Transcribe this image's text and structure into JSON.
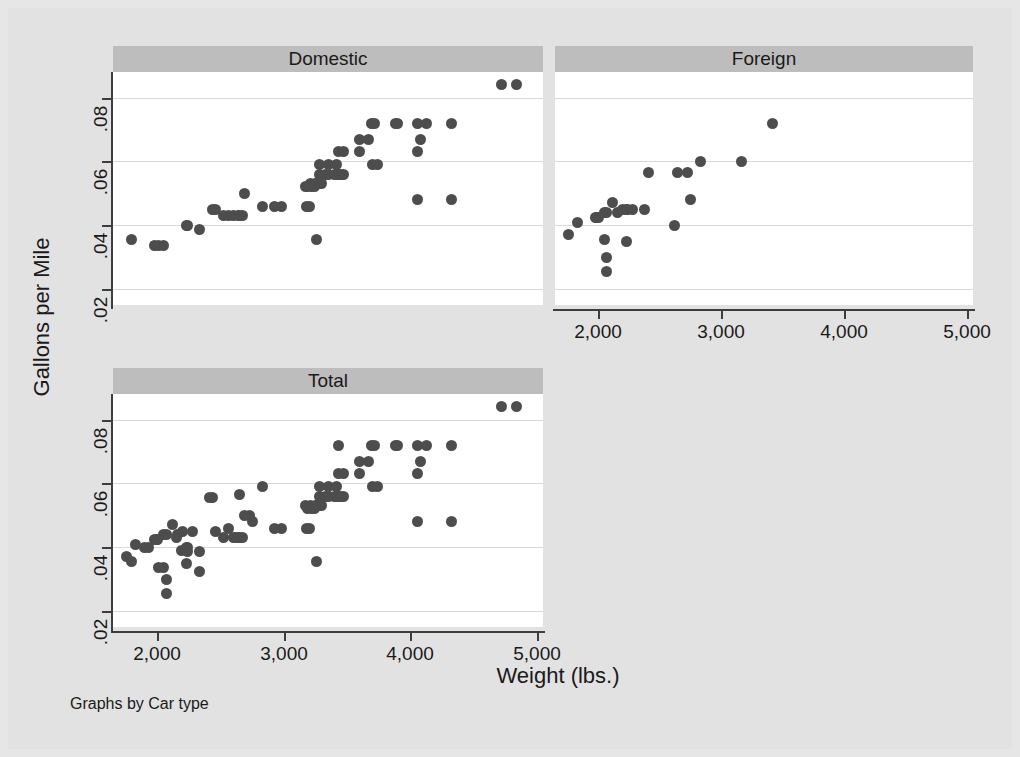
{
  "chart_data": {
    "type": "scatter",
    "title": "",
    "xlabel": "Weight (lbs.)",
    "ylabel": "Gallons per Mile",
    "note": "Graphs by Car type",
    "grid": true,
    "legend": "none",
    "marker_color": "#4d4d4d",
    "panel_title_bg": "#bdbdbd",
    "plot_bg": "#ffffff",
    "page_bg": "#e2e2e2",
    "xlim": [
      1650,
      5050
    ],
    "ylim": [
      0.015,
      0.088
    ],
    "xticks": [
      2000,
      3000,
      4000,
      5000
    ],
    "xtick_labels": [
      "2,000",
      "3,000",
      "4,000",
      "5,000"
    ],
    "yticks": [
      0.02,
      0.04,
      0.06,
      0.08
    ],
    "ytick_labels": [
      ".02",
      ".04",
      ".06",
      ".08"
    ],
    "panels": [
      {
        "label": "Domestic",
        "x": [
          4720,
          4840,
          3690,
          3720,
          3880,
          3900,
          4060,
          4130,
          4330,
          3600,
          3670,
          4080,
          3430,
          3470,
          3600,
          4060,
          3280,
          3350,
          3420,
          3700,
          3740,
          3280,
          3330,
          3350,
          3400,
          3420,
          3430,
          3450,
          3470,
          3210,
          3250,
          3260,
          3280,
          3300,
          3170,
          3190,
          3220,
          3240,
          2930,
          2980,
          3180,
          3200,
          2600,
          2640,
          2650,
          2670,
          2440,
          2460,
          2520,
          2560,
          2230,
          2240,
          2330,
          2690,
          2830,
          1800,
          1980,
          2010,
          2050,
          3260,
          4060,
          4330
        ],
        "y": [
          0.084,
          0.084,
          0.072,
          0.072,
          0.072,
          0.072,
          0.072,
          0.072,
          0.072,
          0.067,
          0.067,
          0.067,
          0.063,
          0.063,
          0.063,
          0.063,
          0.059,
          0.059,
          0.059,
          0.059,
          0.059,
          0.056,
          0.056,
          0.056,
          0.056,
          0.056,
          0.056,
          0.056,
          0.056,
          0.053,
          0.053,
          0.053,
          0.053,
          0.053,
          0.052,
          0.052,
          0.052,
          0.052,
          0.046,
          0.046,
          0.046,
          0.046,
          0.043,
          0.043,
          0.043,
          0.043,
          0.045,
          0.045,
          0.043,
          0.043,
          0.04,
          0.04,
          0.0385,
          0.05,
          0.046,
          0.0355,
          0.0335,
          0.0335,
          0.0335,
          0.0355,
          0.048,
          0.048
        ],
        "n": 52
      },
      {
        "label": "Foreign",
        "x": [
          3420,
          3170,
          2830,
          2650,
          2410,
          2730,
          2750,
          2280,
          2200,
          2230,
          2240,
          2380,
          2120,
          2050,
          2070,
          2160,
          1980,
          1990,
          2000,
          1830,
          1760,
          2050,
          2230,
          2070,
          2070,
          2620
        ],
        "y": [
          0.072,
          0.06,
          0.06,
          0.0565,
          0.0565,
          0.0565,
          0.048,
          0.045,
          0.045,
          0.045,
          0.045,
          0.045,
          0.047,
          0.044,
          0.044,
          0.044,
          0.0425,
          0.0425,
          0.0425,
          0.041,
          0.037,
          0.0355,
          0.035,
          0.03,
          0.0255,
          0.04
        ],
        "n": 26
      },
      {
        "label": "Total",
        "x": [
          4720,
          4840,
          3430,
          3690,
          3720,
          3880,
          3900,
          4060,
          4130,
          4330,
          3600,
          3670,
          4080,
          3430,
          3470,
          3600,
          4060,
          3280,
          3350,
          3420,
          3700,
          3740,
          2830,
          3280,
          3330,
          3350,
          3400,
          3420,
          3430,
          3450,
          3470,
          3170,
          3210,
          3250,
          3260,
          3280,
          3300,
          3190,
          3220,
          3240,
          2930,
          2980,
          3180,
          3200,
          2600,
          2640,
          2650,
          2670,
          2440,
          2460,
          2520,
          2560,
          2230,
          2240,
          2330,
          2690,
          3260,
          4060,
          4330,
          2410,
          2650,
          2730,
          2750,
          2280,
          2200,
          2120,
          2050,
          2070,
          2160,
          1980,
          1990,
          2000,
          1830,
          1760,
          1800,
          2010,
          2050,
          2070,
          2070,
          2230,
          1900,
          1930,
          2620,
          2150,
          2190,
          2240,
          2330
        ],
        "y": [
          0.084,
          0.084,
          0.072,
          0.072,
          0.072,
          0.072,
          0.072,
          0.072,
          0.072,
          0.072,
          0.067,
          0.067,
          0.067,
          0.063,
          0.063,
          0.063,
          0.063,
          0.059,
          0.059,
          0.059,
          0.059,
          0.059,
          0.059,
          0.056,
          0.056,
          0.056,
          0.056,
          0.056,
          0.056,
          0.056,
          0.056,
          0.053,
          0.053,
          0.053,
          0.053,
          0.053,
          0.053,
          0.052,
          0.052,
          0.052,
          0.046,
          0.046,
          0.046,
          0.046,
          0.043,
          0.043,
          0.043,
          0.043,
          0.0555,
          0.045,
          0.043,
          0.046,
          0.04,
          0.04,
          0.0385,
          0.05,
          0.0355,
          0.048,
          0.048,
          0.0555,
          0.0565,
          0.05,
          0.048,
          0.045,
          0.045,
          0.047,
          0.044,
          0.044,
          0.044,
          0.0425,
          0.0425,
          0.0425,
          0.041,
          0.037,
          0.0355,
          0.0335,
          0.0335,
          0.03,
          0.0255,
          0.035,
          0.04,
          0.04,
          0.043,
          0.043,
          0.039,
          0.0385,
          0.0325
        ],
        "n": 78
      }
    ]
  },
  "layout": {
    "panel_positions": [
      {
        "key": "Domestic",
        "title_left": 105,
        "title_top": 38,
        "title_width": 430,
        "plot_left": 105,
        "plot_top": 64,
        "plot_width": 430,
        "plot_height": 233
      },
      {
        "key": "Foreign",
        "title_left": 547,
        "title_top": 38,
        "title_width": 418,
        "plot_left": 547,
        "plot_top": 64,
        "plot_width": 418,
        "plot_height": 233
      },
      {
        "key": "Total",
        "title_left": 105,
        "title_top": 360,
        "title_width": 430,
        "plot_left": 105,
        "plot_top": 386,
        "plot_width": 430,
        "plot_height": 233
      }
    ]
  }
}
